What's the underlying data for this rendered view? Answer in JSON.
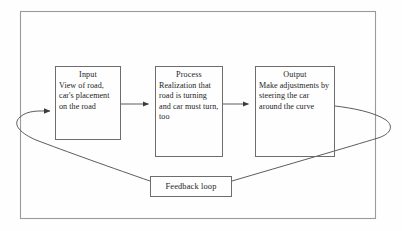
{
  "diagram": {
    "title_text": "",
    "frame": {
      "name": "outer-border",
      "stroke": "#9a9a9a"
    },
    "colors": {
      "background": "#fefefe",
      "box_stroke": "#6d6d6d",
      "connector_stroke": "#4a4a4a",
      "text": "#1d1d1d"
    },
    "nodes": [
      {
        "id": "input",
        "title": "Input",
        "body": "View of road, car's placement on the road"
      },
      {
        "id": "process",
        "title": "Process",
        "body": "Realization that road is turning and car must turn, too"
      },
      {
        "id": "output",
        "title": "Output",
        "body": "Make adjustments by steering the car around the curve"
      }
    ],
    "feedback": {
      "id": "feedback-loop",
      "label": "Feedback loop"
    },
    "connectors": [
      {
        "name": "input-to-process",
        "from": "input",
        "to": "process",
        "arrowhead": true
      },
      {
        "name": "process-to-output",
        "from": "process",
        "to": "output",
        "arrowhead": true
      },
      {
        "name": "output-to-feedback",
        "from": "output",
        "to": "feedback-loop",
        "arrowhead": false
      },
      {
        "name": "feedback-to-input",
        "from": "feedback-loop",
        "to": "input",
        "arrowhead": true
      }
    ]
  }
}
